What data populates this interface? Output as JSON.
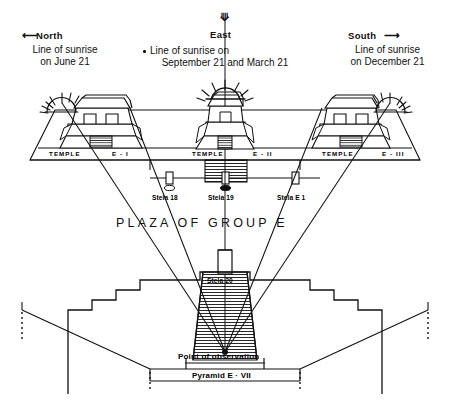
{
  "figure": {
    "ink_color": "#111111",
    "background_color": "#ffffff"
  },
  "compass": {
    "north": {
      "label": "North",
      "arrow_icon": "arrow-left-icon",
      "caption_line1": "Line of sunrise",
      "caption_line2": "on June 21"
    },
    "east": {
      "label": "East",
      "arrow_icon": "arrow-up-icon",
      "caption_line1": "Line of sunrise on",
      "caption_line2": "September 21 and March 21"
    },
    "south": {
      "label": "South",
      "arrow_icon": "arrow-right-icon",
      "caption_line1": "Line of sunrise",
      "caption_line2": "on December 21"
    }
  },
  "temples": [
    {
      "name_word": "TEMPLE",
      "designation": "E - I",
      "sun_icon": "sunburst-icon"
    },
    {
      "name_word": "TEMPLE",
      "designation": "E - II",
      "sun_icon": "sunburst-icon"
    },
    {
      "name_word": "TEMPLE",
      "designation": "E - III",
      "sun_icon": "sunburst-icon"
    }
  ],
  "stelae": [
    {
      "label": "Stela 18"
    },
    {
      "label": "Stela 19"
    },
    {
      "label": "Stela E 1"
    },
    {
      "label": "Stela 20"
    }
  ],
  "plaza": {
    "label": "PLAZA  OF  GROUP  E"
  },
  "pyramid": {
    "observation_label": "Point of observation",
    "name_label": "Pyramid E · VII"
  }
}
